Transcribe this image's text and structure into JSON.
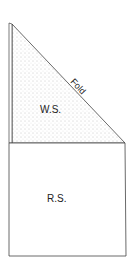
{
  "diagram": {
    "labels": {
      "fold": "Fold",
      "wrong_side": "W.S.",
      "right_side": "R.S."
    },
    "colors": {
      "line": "#444444",
      "stipple": "#8a8a8a",
      "background": "#ffffff"
    }
  }
}
